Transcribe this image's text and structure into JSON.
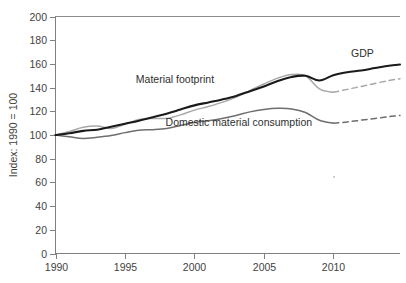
{
  "chart_data": {
    "type": "line",
    "title": "",
    "subtitle": "",
    "xlabel": "",
    "ylabel": "Index: 1990 = 100",
    "xlim": [
      1990,
      2014.8
    ],
    "ylim": [
      0,
      200
    ],
    "grid": false,
    "legend_position": "inline-annotations",
    "y_ticks": [
      0,
      20,
      40,
      60,
      80,
      100,
      120,
      140,
      160,
      180,
      200
    ],
    "y_tick_labels": [
      "0",
      "20",
      "40",
      "60",
      "80",
      "100",
      "120",
      "140",
      "160",
      "180",
      "200"
    ],
    "x_ticks": [
      1990,
      1995,
      2000,
      2005,
      2010
    ],
    "x_tick_labels": [
      "1990",
      "1995",
      "2000",
      "2005",
      "2010"
    ],
    "x_minor_ticks": [],
    "colors": {
      "gdp": "#1a1a1a",
      "material_footprint": "#a8a8a8",
      "domestic_material_consumption": "#6e6e6e",
      "axis": "#808080",
      "text": "#3f3f3f",
      "background": "#ffffff"
    },
    "annotations": [
      {
        "text": "GDP",
        "x": 2012.1,
        "y": 166,
        "name": "gdp"
      },
      {
        "text": "Material footprint",
        "x": 1998.6,
        "y": 144,
        "name": "material-footprint"
      },
      {
        "text": "Domestic material consumption",
        "x": 2003.2,
        "y": 108,
        "name": "domestic-material-consumption"
      }
    ],
    "series": [
      {
        "name": "GDP",
        "label": "GDP",
        "color": "#1a1a1a",
        "width": 2.1,
        "style": "solid",
        "x": [
          1990,
          1991,
          1992,
          1993,
          1994,
          1995,
          1996,
          1997,
          1998,
          1999,
          2000,
          2001,
          2002,
          2003,
          2004,
          2005,
          2006,
          2007,
          2008,
          2009,
          2010,
          2011,
          2012,
          2013,
          2014,
          2014.8
        ],
        "values": [
          100,
          101.5,
          103.5,
          104.5,
          107,
          109.5,
          112,
          115,
          118,
          121.5,
          125,
          127.5,
          130,
          133,
          137,
          141,
          145.5,
          149,
          150,
          146,
          150.5,
          153,
          154.5,
          156.5,
          158.5,
          159.5
        ]
      },
      {
        "name": "Material footprint",
        "label": "Material footprint",
        "color": "#a8a8a8",
        "width": 1.5,
        "style": "solid-then-dashed",
        "dash_from": 2010,
        "x": [
          1990,
          1991,
          1992,
          1993,
          1994,
          1995,
          1996,
          1997,
          1998,
          1999,
          2000,
          2001,
          2002,
          2003,
          2004,
          2005,
          2006,
          2007,
          2008,
          2009,
          2010,
          2011,
          2012,
          2013,
          2014,
          2014.8
        ],
        "values": [
          100,
          103,
          106.5,
          107.5,
          105.5,
          109,
          113,
          114,
          114,
          117,
          121,
          124,
          127.5,
          132,
          137.5,
          143,
          148,
          151,
          150,
          139,
          136,
          138.5,
          141,
          143.5,
          146,
          147.5
        ]
      },
      {
        "name": "Domestic material consumption",
        "label": "Domestic material consumption",
        "color": "#6e6e6e",
        "width": 1.5,
        "style": "solid-then-dashed",
        "dash_from": 2010,
        "x": [
          1990,
          1991,
          1992,
          1993,
          1994,
          1995,
          1996,
          1997,
          1998,
          1999,
          2000,
          2001,
          2002,
          2003,
          2004,
          2005,
          2006,
          2007,
          2008,
          2009,
          2010,
          2011,
          2012,
          2013,
          2014,
          2014.8
        ],
        "values": [
          100,
          98.5,
          97,
          98,
          99.5,
          102,
          104,
          104.5,
          105.5,
          108,
          110.5,
          112,
          114,
          116.5,
          119.5,
          121.5,
          122.5,
          122,
          119,
          112.5,
          110,
          111,
          112.5,
          114,
          115.5,
          116.5
        ]
      }
    ]
  },
  "axes": {
    "ylabel": "Index: 1990 = 100",
    "y_tick_labels": [
      "200",
      "180",
      "160",
      "140",
      "120",
      "100",
      "80",
      "60",
      "40",
      "20",
      "0"
    ],
    "x_tick_labels": [
      "1990",
      "1995",
      "2000",
      "2005",
      "2010"
    ]
  },
  "labels": {
    "gdp": "GDP",
    "material_footprint": "Material footprint",
    "domestic_material_consumption": "Domestic material consumption"
  }
}
